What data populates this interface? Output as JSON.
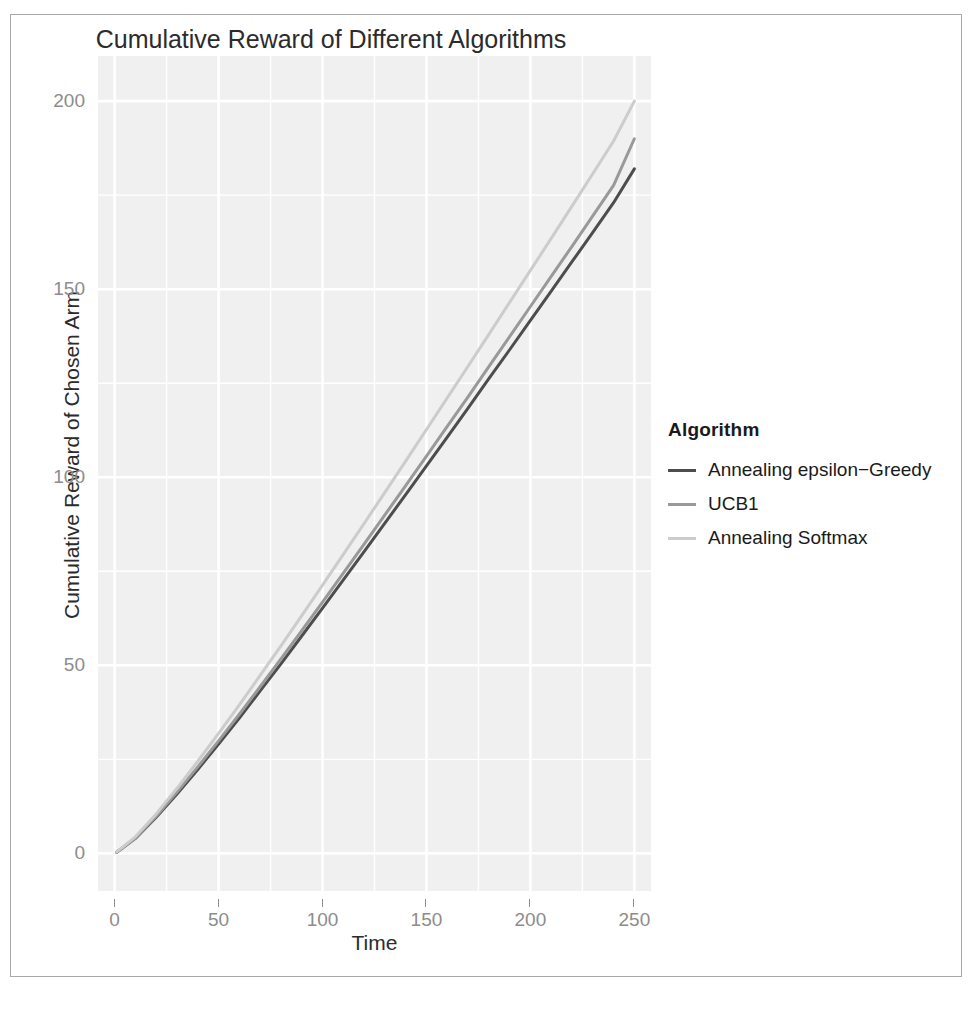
{
  "chart_data": {
    "type": "line",
    "title": "Cumulative Reward of Different Algorithms",
    "xlabel": "Time",
    "ylabel": "Cumulative Reward of Chosen Arm",
    "xlim": [
      -8,
      258
    ],
    "ylim": [
      -10,
      212
    ],
    "xticks": [
      0,
      50,
      100,
      150,
      200,
      250
    ],
    "yticks": [
      0,
      50,
      100,
      150,
      200
    ],
    "grid": true,
    "legend_position": "right",
    "legend_title": "Algorithm",
    "x": [
      1,
      10,
      20,
      30,
      40,
      50,
      60,
      70,
      80,
      90,
      100,
      110,
      120,
      130,
      140,
      150,
      160,
      170,
      180,
      190,
      200,
      210,
      220,
      230,
      240,
      250
    ],
    "series": [
      {
        "name": "Annealing epsilon-Greedy",
        "label": "Annealing epsilon−Greedy",
        "color": "#4d4d4d",
        "values": [
          0.3,
          4.0,
          9.6,
          15.8,
          22.3,
          29.1,
          36.0,
          43.2,
          50.4,
          57.8,
          65.2,
          72.7,
          80.2,
          87.8,
          95.4,
          103.0,
          110.7,
          118.4,
          126.2,
          133.9,
          141.7,
          149.5,
          157.3,
          165.1,
          173.0,
          182.0
        ]
      },
      {
        "name": "UCB1",
        "label": "UCB1",
        "color": "#999999",
        "values": [
          0.3,
          4.1,
          9.9,
          16.3,
          23.0,
          29.9,
          37.0,
          44.3,
          51.7,
          59.2,
          66.8,
          74.5,
          82.2,
          90.0,
          97.8,
          105.6,
          113.5,
          121.4,
          129.4,
          137.4,
          145.4,
          153.4,
          161.4,
          169.5,
          177.6,
          190.0
        ]
      },
      {
        "name": "Annealing Softmax",
        "label": "Annealing Softmax",
        "color": "#cccccc",
        "values": [
          0.4,
          4.4,
          10.5,
          17.3,
          24.5,
          31.9,
          39.5,
          47.3,
          55.2,
          63.2,
          71.3,
          79.5,
          87.7,
          96.0,
          104.3,
          112.7,
          121.1,
          129.5,
          138.0,
          146.5,
          155.0,
          163.5,
          172.1,
          180.7,
          189.4,
          200.0
        ]
      }
    ]
  },
  "panel": {
    "background_color": "#f0f0f0",
    "gridline_color": "#ffffff"
  },
  "axis": {
    "tick_label_color": "#8c8c8c",
    "title_color": "#2b2b2b"
  }
}
